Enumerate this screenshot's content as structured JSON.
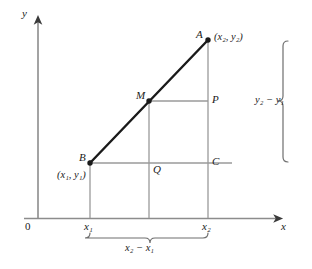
{
  "figure": {
    "type": "coordinate-geometry-diagram",
    "colors": {
      "segment": "#1a1a1a",
      "axis": "#8c8c8c",
      "guide_line": "#9a9a9a",
      "brace": "#6e6e6e",
      "text": "#1a1a1a",
      "background": "#ffffff"
    }
  },
  "axes": {
    "y_axis_label": "y",
    "x_axis_label": "x",
    "origin_label": "0",
    "x_tick_labels": [
      "x₁",
      "x₂"
    ]
  },
  "points": {
    "a": {
      "label": "A",
      "coord_label": "(x₂, y₂)",
      "x": 208,
      "y": 40
    },
    "b": {
      "label": "B",
      "coord_label": "(x₁, y₁)",
      "x": 90,
      "y": 163
    },
    "m": {
      "label": "M",
      "x": 149,
      "y": 101
    },
    "p": {
      "label": "P",
      "x": 208,
      "y": 101
    },
    "q": {
      "label": "Q",
      "x": 149,
      "y": 163
    },
    "c": {
      "label": "C",
      "x": 208,
      "y": 163
    }
  },
  "braces": {
    "vertical": {
      "label": "y₂ − y₁",
      "spans": "from y₂ down to y₁"
    },
    "horizontal": {
      "label": "x₂ − x₁",
      "spans": "from x₁ across to x₂"
    }
  },
  "tick_x1": "x₁",
  "tick_x2": "x₂"
}
